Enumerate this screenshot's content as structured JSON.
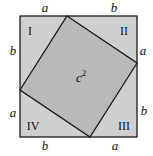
{
  "colors": {
    "outer_fill": "#cfcfcf",
    "inner_fill": "#b9b9b9",
    "stroke": "#1a1a1a"
  },
  "outer_square": {
    "x": 20,
    "y": 16,
    "size": 117
  },
  "inner_square": {
    "vertices": [
      [
        67,
        16
      ],
      [
        137,
        63
      ],
      [
        90,
        137
      ],
      [
        20,
        90
      ]
    ],
    "label_base": "c",
    "label_exp": "2"
  },
  "regions": {
    "top_left": "I",
    "top_right": "II",
    "bottom_right": "III",
    "bottom_left": "IV"
  },
  "side_labels": {
    "top_left": "a",
    "top_right": "b",
    "right_top": "a",
    "right_bottom": "b",
    "bottom_right": "a",
    "bottom_left": "b",
    "left_bottom": "a",
    "left_top": "b"
  }
}
